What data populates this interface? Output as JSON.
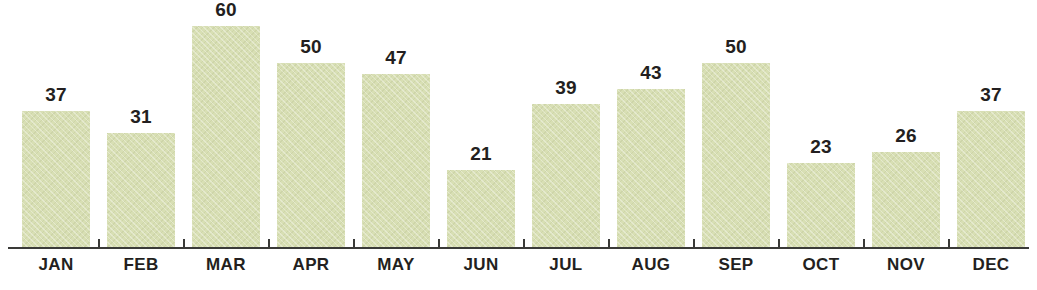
{
  "chart_data": {
    "type": "bar",
    "title": "",
    "subtitle": "",
    "xlabel": "",
    "ylabel": "",
    "categories": [
      "JAN",
      "FEB",
      "MAR",
      "APR",
      "MAY",
      "JUN",
      "JUL",
      "AUG",
      "SEP",
      "OCT",
      "NOV",
      "DEC"
    ],
    "values": [
      37,
      31,
      60,
      50,
      47,
      21,
      39,
      43,
      50,
      23,
      26,
      37
    ],
    "data_labels": [
      "37",
      "31",
      "60",
      "50",
      "47",
      "21",
      "39",
      "43",
      "50",
      "23",
      "26",
      "37"
    ],
    "ylim": [
      0,
      60
    ],
    "grid": false,
    "legend": false,
    "legend_position": "none",
    "axis_ticks_visible": true,
    "y_axis_visible": false,
    "x_axis_visible": true,
    "bar_color": "#d8dfb4",
    "label_color": "#231f20",
    "axis_color": "#3a3a38",
    "background_color": "#ffffff"
  }
}
